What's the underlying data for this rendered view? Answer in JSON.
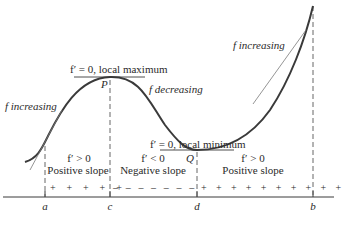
{
  "figure": {
    "curve_labels": {
      "f_increasing_left": "f increasing",
      "f_increasing_right": "f increasing",
      "f_decreasing": "f decreasing",
      "local_max": "f′ = 0, local maximum",
      "local_min": "f′ = 0, local minimum",
      "point_P": "P",
      "point_Q": "Q"
    },
    "intervals": [
      {
        "condition": "f′ > 0",
        "description": "Positive slope",
        "signs": "+ + + + +"
      },
      {
        "condition": "f′ < 0",
        "description": "Negative slope",
        "signs": "– – – – – – –"
      },
      {
        "condition": "f′ > 0",
        "description": "Positive slope",
        "signs": "+ + + + + + + + + +"
      }
    ],
    "axis_ticks": [
      "a",
      "c",
      "d",
      "b"
    ],
    "colors": {
      "curve": "#3a3a3a",
      "tangent": "#7a7a7a",
      "axis": "#3a3a3a",
      "text": "#2a2a2a"
    }
  }
}
